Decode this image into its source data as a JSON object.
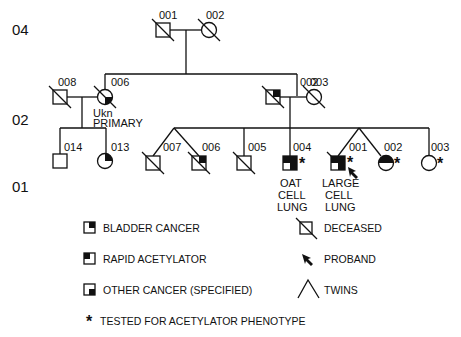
{
  "generations": [
    {
      "label": "04"
    },
    {
      "label": "02"
    },
    {
      "label": "01"
    }
  ],
  "individuals": {
    "g04_001": {
      "id": "001",
      "sex": "male",
      "deceased": true,
      "bladder_cancer": false,
      "rapid_acetylator": false,
      "other_cancer": false
    },
    "g04_002": {
      "id": "002",
      "sex": "female",
      "deceased": true
    },
    "g02_008": {
      "id": "008",
      "sex": "male",
      "deceased": true
    },
    "g02_006": {
      "id": "006",
      "sex": "female",
      "deceased": true,
      "other_cancer": true,
      "note_line1": "Ukn",
      "note_line2": "PRIMARY"
    },
    "g02_002": {
      "id": "002",
      "sex": "male",
      "deceased": true,
      "bladder_cancer": true
    },
    "g02_003": {
      "id": "003",
      "sex": "female",
      "deceased": true
    },
    "g01_014": {
      "id": "014",
      "sex": "male",
      "deceased": false
    },
    "g01_013": {
      "id": "013",
      "sex": "female",
      "deceased": false,
      "bladder_cancer": true
    },
    "g01_007": {
      "id": "007",
      "sex": "male",
      "deceased": true,
      "twin": true
    },
    "g01_006": {
      "id": "006",
      "sex": "male",
      "deceased": true,
      "twin": true,
      "bladder_cancer": true
    },
    "g01_005": {
      "id": "005",
      "sex": "male",
      "deceased": true
    },
    "g01_004": {
      "id": "004",
      "sex": "male",
      "deceased": false,
      "bladder_cancer": true,
      "rapid_acetylator": true,
      "other_cancer": true,
      "tested": true,
      "note_line1": "OAT",
      "note_line2": "CELL",
      "note_line3": "LUNG"
    },
    "g01_001": {
      "id": "001",
      "sex": "male",
      "deceased": true,
      "twin": true,
      "proband": true,
      "bladder_cancer": true,
      "rapid_acetylator": true,
      "other_cancer": true,
      "tested": true,
      "note_line1": "LARGE",
      "note_line2": "CELL",
      "note_line3": "LUNG"
    },
    "g01_002": {
      "id": "002",
      "sex": "female",
      "deceased": false,
      "twin": true,
      "rapid_acetylator": true,
      "bladder_cancer": true,
      "tested": true
    },
    "g01_003": {
      "id": "003",
      "sex": "female",
      "deceased": false,
      "tested": true
    }
  },
  "tested_marker": "*",
  "legend": {
    "bladder_cancer": "BLADDER CANCER",
    "rapid_acetylator": "RAPID ACETYLATOR",
    "other_cancer": "OTHER CANCER (SPECIFIED)",
    "tested": "TESTED FOR ACETYLATOR PHENOTYPE",
    "deceased": "DECEASED",
    "proband": "PROBAND",
    "twins": "TWINS"
  }
}
